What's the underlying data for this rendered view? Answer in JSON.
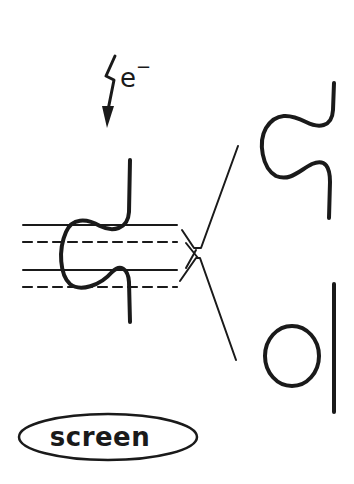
{
  "diagram": {
    "electron_beam": {
      "symbol": "e",
      "charge": "−",
      "icon": "lightning-arrow-icon"
    },
    "specimen": {
      "description": "S-shaped molecule on layered support lines (solid and dashed)",
      "support_lines": [
        "solid",
        "dashed",
        "solid",
        "dashed"
      ]
    },
    "projections": [
      {
        "name": "s-shaped-image",
        "shape": "S-curve"
      },
      {
        "name": "ring-and-rod-image",
        "shape": "circle with vertical rod"
      }
    ],
    "screen": {
      "label": "screen"
    },
    "colors": {
      "ink": "#1a1a1a",
      "background": "#ffffff"
    }
  }
}
